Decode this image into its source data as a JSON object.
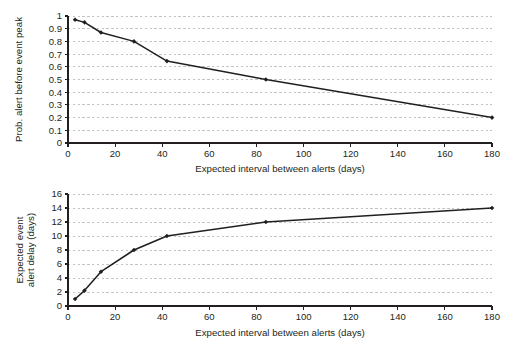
{
  "chart_data": [
    {
      "id": "top",
      "type": "line",
      "title": "",
      "xlabel": "Expected interval between alerts (days)",
      "ylabel": "Prob. alert before event peak",
      "xlim": [
        0,
        180
      ],
      "ylim": [
        0,
        1
      ],
      "xticks": [
        0,
        20,
        40,
        60,
        80,
        100,
        120,
        140,
        160,
        180
      ],
      "xticklabels": [
        "0",
        "20",
        "40",
        "60",
        "80",
        "100",
        "120",
        "140",
        "160",
        "180"
      ],
      "yticks": [
        0,
        0.1,
        0.2,
        0.3,
        0.4,
        0.5,
        0.6,
        0.7,
        0.8,
        0.9,
        1
      ],
      "yticklabels": [
        "0",
        "0.1",
        "0.2",
        "0.3",
        "0.4",
        "0.5",
        "0.6",
        "0.7",
        "0.8",
        "0.9",
        "1"
      ],
      "grid": "horizontal-dashed",
      "legend": "none",
      "marker": "diamond",
      "line_color": "#231f20",
      "grid_color": "#bcbcbc",
      "x": [
        3,
        7,
        14,
        28,
        42,
        84,
        180
      ],
      "values": [
        0.97,
        0.95,
        0.87,
        0.8,
        0.645,
        0.5,
        0.2
      ]
    },
    {
      "id": "bottom",
      "type": "line",
      "title": "",
      "xlabel": "Expected interval between alerts (days)",
      "ylabel": "Expected event alert delay (days)",
      "ylabel_lines": [
        "Expected event",
        "alert delay (days)"
      ],
      "xlim": [
        0,
        180
      ],
      "ylim": [
        0,
        16
      ],
      "xticks": [
        0,
        20,
        40,
        60,
        80,
        100,
        120,
        140,
        160,
        180
      ],
      "xticklabels": [
        "0",
        "20",
        "40",
        "60",
        "80",
        "100",
        "120",
        "140",
        "160",
        "180"
      ],
      "yticks": [
        0,
        2,
        4,
        6,
        8,
        10,
        12,
        14,
        16
      ],
      "yticklabels": [
        "0",
        "2",
        "4",
        "6",
        "8",
        "10",
        "12",
        "14",
        "16"
      ],
      "grid": "horizontal-dashed",
      "legend": "none",
      "marker": "diamond",
      "line_color": "#231f20",
      "grid_color": "#bcbcbc",
      "x": [
        3,
        7,
        14,
        28,
        42,
        84,
        180
      ],
      "values": [
        1.0,
        2.2,
        4.9,
        8.0,
        10.0,
        12.0,
        14.0
      ]
    }
  ]
}
